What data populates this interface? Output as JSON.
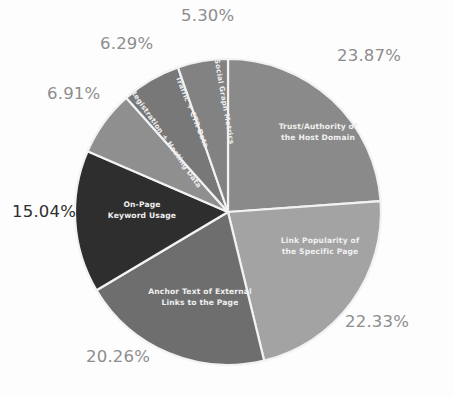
{
  "chart_data": {
    "type": "pie",
    "title": "",
    "subtitle": "",
    "xlabel": "",
    "ylabel": "",
    "legend_position": "none",
    "grid": false,
    "labels_inside_slices": true,
    "value_unit": "percent",
    "categories": [
      "Trust/Authority of the Host Domain",
      "Link Popularity of the Specific Page",
      "Anchor Text of External Links to the Page",
      "On-Page Keyword Usage",
      "Registration + Hosting Data",
      "Traffic + CTR Data",
      "Social Graph Metrics"
    ],
    "values": [
      23.87,
      22.33,
      20.26,
      15.04,
      6.91,
      6.29,
      5.3
    ],
    "value_labels": [
      "23.87%",
      "22.33%",
      "20.26%",
      "15.04%",
      "6.91%",
      "6.29%",
      "5.30%"
    ],
    "colors": [
      "#8a8a8a",
      "#a3a3a3",
      "#6e6e6e",
      "#2e2e2e",
      "#8f8f8f",
      "#787878",
      "#828282"
    ],
    "start_angle_deg": 0,
    "direction": "clockwise",
    "slices": [
      {
        "name": "Trust/Authority of the Host Domain",
        "value": 23.87,
        "value_label": "23.87%",
        "color": "#8a8a8a",
        "label_line_1": "Trust/Authority of",
        "label_line_2": "the Host Domain",
        "label_rotation_deg": 0,
        "label_x": 318,
        "label_y": 129,
        "pct_x": 337,
        "pct_y": 46,
        "pct_dark": false
      },
      {
        "name": "Link Popularity of the Specific Page",
        "value": 22.33,
        "value_label": "22.33%",
        "color": "#a3a3a3",
        "label_line_1": "Link Popularity of",
        "label_line_2": "the Specific Page",
        "label_rotation_deg": 0,
        "label_x": 320,
        "label_y": 243,
        "pct_x": 345,
        "pct_y": 312,
        "pct_dark": false
      },
      {
        "name": "Anchor Text of External Links to the Page",
        "value": 20.26,
        "value_label": "20.26%",
        "color": "#6e6e6e",
        "label_line_1": "Anchor Text of External",
        "label_line_2": "Links to the Page",
        "label_rotation_deg": 0,
        "label_x": 200,
        "label_y": 294,
        "pct_x": 86,
        "pct_y": 347,
        "pct_dark": false
      },
      {
        "name": "On-Page Keyword Usage",
        "value": 15.04,
        "value_label": "15.04%",
        "color": "#2e2e2e",
        "label_line_1": "On-Page",
        "label_line_2": "Keyword Usage",
        "label_rotation_deg": 0,
        "label_x": 142,
        "label_y": 207,
        "pct_x": 12,
        "pct_y": 202,
        "pct_dark": true
      },
      {
        "name": "Registration + Hosting Data",
        "value": 6.91,
        "value_label": "6.91%",
        "color": "#8f8f8f",
        "label_line_1": "Registration + Hosting Data",
        "label_line_2": "",
        "label_rotation_deg": 55,
        "label_x": 164,
        "label_y": 140,
        "pct_x": 47,
        "pct_y": 84,
        "pct_dark": false
      },
      {
        "name": "Traffic + CTR Data",
        "value": 6.29,
        "value_label": "6.29%",
        "color": "#787878",
        "label_line_1": "Traffic + CTR Data",
        "label_line_2": "",
        "label_rotation_deg": 68,
        "label_x": 190,
        "label_y": 113,
        "pct_x": 100,
        "pct_y": 34,
        "pct_dark": false
      },
      {
        "name": "Social Graph Metrics",
        "value": 5.3,
        "value_label": "5.30%",
        "color": "#828282",
        "label_line_1": "Social Graph Metrics",
        "label_line_2": "",
        "label_rotation_deg": 80,
        "label_x": 222,
        "label_y": 102,
        "pct_x": 181,
        "pct_y": 6,
        "pct_dark": false
      }
    ],
    "geometry": {
      "center_x": 228,
      "center_y": 212,
      "radius": 153
    },
    "background_color": "#fdfdfd",
    "slice_border_color": "#f2f2f2",
    "inside_label_color": "#f0f0f0",
    "pct_label_color": "#8d8d8d",
    "pct_label_color_emphasis": "#2f2f2f"
  }
}
